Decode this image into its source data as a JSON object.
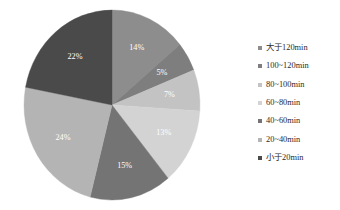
{
  "chart_data": {
    "type": "pie",
    "title": "",
    "subtitle": "",
    "legend_position": "right",
    "start_angle_deg": 0,
    "direction": "clockwise",
    "categories": [
      "大于120min",
      "100~120min",
      "80~100min",
      "60~80min",
      "40~60min",
      "20~40min",
      "小于20min"
    ],
    "values": [
      14,
      5,
      7,
      13,
      15,
      24,
      22
    ],
    "value_unit": "%",
    "data_labels": [
      "14%",
      "5%",
      "7%",
      "13%",
      "15%",
      "24%",
      "22%"
    ],
    "colors": [
      "#8d8d8d",
      "#7e7e7e",
      "#c3c3c3",
      "#d3d3d3",
      "#747474",
      "#b4b4b4",
      "#4a4a4a"
    ],
    "xlabel": "",
    "ylabel": "",
    "background": "#ffffff",
    "label_text_color": "#ffffff"
  },
  "legend": {
    "items": [
      {
        "label": "大于120min",
        "color": "#8d8d8d"
      },
      {
        "label": "100~120min",
        "color": "#7e7e7e"
      },
      {
        "label": "80~100min",
        "color": "#c3c3c3"
      },
      {
        "label": "60~80min",
        "color": "#d3d3d3"
      },
      {
        "label": "40~60min",
        "color": "#747474"
      },
      {
        "label": "20~40min",
        "color": "#b4b4b4"
      },
      {
        "label": "小于20min",
        "color": "#4a4a4a"
      }
    ]
  }
}
